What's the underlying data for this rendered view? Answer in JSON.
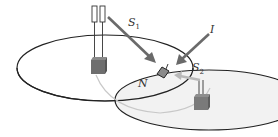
{
  "diagram": {
    "labels": {
      "s1": "S",
      "s1_sub": "1",
      "s2": "S",
      "s2_sub": "2",
      "i": "I",
      "n": "N"
    },
    "colors": {
      "outline": "#222222",
      "arrow": "#6a6a6a",
      "base_station": "#6e6e6e",
      "second_area_fill": "#f0f0f0",
      "link_curve": "#c8c8c8",
      "device": "#8a8a8a"
    },
    "elements": [
      "primary-coverage-ellipse",
      "secondary-coverage-ellipse",
      "primary-base-station",
      "secondary-base-station",
      "node-N-device",
      "signal-arrow-S1",
      "interference-arrow-I",
      "signal-arrow-S2"
    ]
  }
}
